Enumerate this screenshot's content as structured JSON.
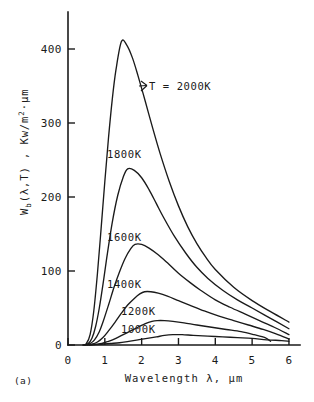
{
  "figure": {
    "caption": "(a)",
    "background": "#ffffff",
    "ink_color": "#1a1a1a"
  },
  "chart_data": {
    "type": "line",
    "title": "",
    "subtitle": "",
    "xlabel_parts": {
      "word": "Wavelength",
      "symbol": "λ,",
      "unit": "μm"
    },
    "xlabel": "Wavelength λ, μm",
    "ylabel_parts": {
      "head": "W",
      "sub": "b",
      "args": "(λ,T) , Kw/m",
      "sup": "2",
      "tail": "·μm"
    },
    "ylabel": "W_b(λ,T) , Kw/m²·μm",
    "x": {
      "min": 0,
      "max": 6.3,
      "ticks": [
        0,
        1,
        2,
        3,
        4,
        5,
        6
      ],
      "ticklabels": [
        "0",
        "1",
        "2",
        "3",
        "4",
        "5",
        "6"
      ]
    },
    "y": {
      "min": 0,
      "max": 450,
      "ticks": [
        0,
        100,
        200,
        300,
        400
      ],
      "ticklabels": [
        "0",
        "100",
        "200",
        "300",
        "400"
      ]
    },
    "grid": false,
    "legend_position": "inline-annotations",
    "annotations": [
      {
        "text": "T = 2000K",
        "x_px": 149,
        "y_px": 90,
        "leader": true
      },
      {
        "text": "1800K",
        "x_px": 107,
        "y_px": 158,
        "leader": false
      },
      {
        "text": "1600K",
        "x_px": 107,
        "y_px": 241,
        "leader": false
      },
      {
        "text": "1400K",
        "x_px": 107,
        "y_px": 288,
        "leader": false
      },
      {
        "text": "1200K",
        "x_px": 121,
        "y_px": 315,
        "leader": false
      },
      {
        "text": "1000K",
        "x_px": 121,
        "y_px": 333,
        "leader": false
      }
    ],
    "series": [
      {
        "name": "2000K",
        "temperature_K": 2000,
        "peak": {
          "lambda_um": 1.45,
          "value": 410
        },
        "points": [
          [
            0.4,
            0
          ],
          [
            0.5,
            2
          ],
          [
            0.6,
            14
          ],
          [
            0.7,
            46
          ],
          [
            0.8,
            97
          ],
          [
            0.9,
            158
          ],
          [
            1.0,
            221
          ],
          [
            1.1,
            280
          ],
          [
            1.2,
            331
          ],
          [
            1.3,
            371
          ],
          [
            1.45,
            410
          ],
          [
            1.6,
            405
          ],
          [
            1.75,
            388
          ],
          [
            1.9,
            364
          ],
          [
            2.1,
            329
          ],
          [
            2.3,
            293
          ],
          [
            2.5,
            259
          ],
          [
            2.75,
            221
          ],
          [
            3.0,
            188
          ],
          [
            3.25,
            160
          ],
          [
            3.5,
            137
          ],
          [
            3.75,
            118
          ],
          [
            4.0,
            102
          ],
          [
            4.5,
            78
          ],
          [
            5.0,
            60
          ],
          [
            5.5,
            45
          ],
          [
            6.0,
            31
          ]
        ]
      },
      {
        "name": "1800K",
        "temperature_K": 1800,
        "peak": {
          "lambda_um": 1.62,
          "value": 238
        },
        "points": [
          [
            0.42,
            0
          ],
          [
            0.55,
            2
          ],
          [
            0.65,
            9
          ],
          [
            0.75,
            25
          ],
          [
            0.85,
            50
          ],
          [
            0.95,
            82
          ],
          [
            1.05,
            117
          ],
          [
            1.2,
            165
          ],
          [
            1.35,
            202
          ],
          [
            1.5,
            227
          ],
          [
            1.62,
            238
          ],
          [
            1.8,
            236
          ],
          [
            2.0,
            226
          ],
          [
            2.2,
            210
          ],
          [
            2.4,
            191
          ],
          [
            2.6,
            172
          ],
          [
            2.9,
            146
          ],
          [
            3.2,
            124
          ],
          [
            3.5,
            105
          ],
          [
            3.8,
            90
          ],
          [
            4.2,
            74
          ],
          [
            4.6,
            61
          ],
          [
            5.0,
            50
          ],
          [
            5.5,
            36
          ],
          [
            6.0,
            22
          ]
        ]
      },
      {
        "name": "1600K",
        "temperature_K": 1600,
        "peak": {
          "lambda_um": 1.82,
          "value": 136
        },
        "points": [
          [
            0.45,
            0
          ],
          [
            0.6,
            2
          ],
          [
            0.72,
            7
          ],
          [
            0.85,
            18
          ],
          [
            0.95,
            31
          ],
          [
            1.1,
            54
          ],
          [
            1.25,
            78
          ],
          [
            1.4,
            99
          ],
          [
            1.55,
            117
          ],
          [
            1.7,
            130
          ],
          [
            1.82,
            136
          ],
          [
            2.0,
            136
          ],
          [
            2.2,
            131
          ],
          [
            2.45,
            122
          ],
          [
            2.7,
            111
          ],
          [
            3.0,
            97
          ],
          [
            3.3,
            85
          ],
          [
            3.6,
            74
          ],
          [
            4.0,
            61
          ],
          [
            4.4,
            51
          ],
          [
            4.8,
            42
          ],
          [
            5.2,
            33
          ],
          [
            5.6,
            24
          ],
          [
            6.0,
            14
          ]
        ]
      },
      {
        "name": "1400K",
        "temperature_K": 1400,
        "peak": {
          "lambda_um": 2.08,
          "value": 72
        },
        "points": [
          [
            0.48,
            0
          ],
          [
            0.65,
            1
          ],
          [
            0.8,
            4
          ],
          [
            0.95,
            10
          ],
          [
            1.1,
            19
          ],
          [
            1.28,
            31
          ],
          [
            1.45,
            43
          ],
          [
            1.62,
            54
          ],
          [
            1.8,
            63
          ],
          [
            1.95,
            69
          ],
          [
            2.08,
            72
          ],
          [
            2.25,
            72
          ],
          [
            2.45,
            70
          ],
          [
            2.7,
            66
          ],
          [
            3.0,
            60
          ],
          [
            3.3,
            54
          ],
          [
            3.7,
            46
          ],
          [
            4.1,
            39
          ],
          [
            4.5,
            33
          ],
          [
            4.9,
            27
          ],
          [
            5.3,
            21
          ],
          [
            5.65,
            15
          ],
          [
            6.0,
            8
          ]
        ]
      },
      {
        "name": "1200K",
        "temperature_K": 1200,
        "peak": {
          "lambda_um": 2.42,
          "value": 33
        },
        "points": [
          [
            0.52,
            0
          ],
          [
            0.75,
            1
          ],
          [
            0.92,
            2
          ],
          [
            1.1,
            5
          ],
          [
            1.3,
            9
          ],
          [
            1.5,
            14
          ],
          [
            1.7,
            19
          ],
          [
            1.9,
            24
          ],
          [
            2.1,
            29
          ],
          [
            2.28,
            32
          ],
          [
            2.42,
            33
          ],
          [
            2.62,
            33
          ],
          [
            2.85,
            32
          ],
          [
            3.15,
            30
          ],
          [
            3.5,
            27
          ],
          [
            3.9,
            24
          ],
          [
            4.3,
            21
          ],
          [
            4.7,
            18
          ],
          [
            5.05,
            14
          ],
          [
            5.35,
            10
          ],
          [
            5.5,
            5
          ]
        ]
      },
      {
        "name": "1000K",
        "temperature_K": 1000,
        "peak": {
          "lambda_um": 2.85,
          "value": 14
        },
        "points": [
          [
            0.58,
            0
          ],
          [
            0.9,
            1
          ],
          [
            1.15,
            2
          ],
          [
            1.4,
            3
          ],
          [
            1.65,
            5
          ],
          [
            1.9,
            7
          ],
          [
            2.15,
            9
          ],
          [
            2.4,
            11
          ],
          [
            2.62,
            13
          ],
          [
            2.85,
            14
          ],
          [
            3.1,
            14
          ],
          [
            3.4,
            13
          ],
          [
            3.8,
            12
          ],
          [
            4.2,
            11
          ],
          [
            4.6,
            10
          ],
          [
            5.0,
            9
          ],
          [
            5.4,
            7
          ],
          [
            5.8,
            6
          ],
          [
            6.0,
            5
          ]
        ]
      }
    ]
  }
}
